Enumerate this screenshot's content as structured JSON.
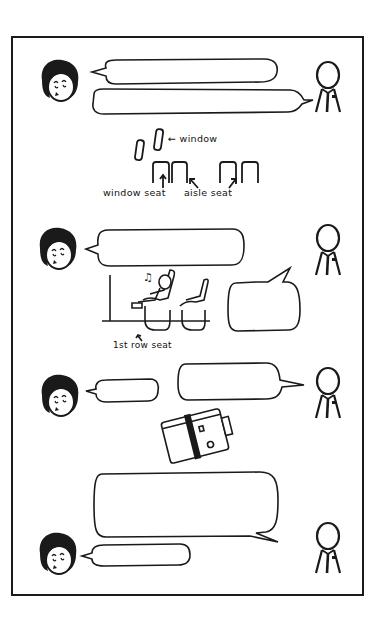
{
  "comic": {
    "panel_count": 1,
    "stroke_color": "#1a1a1a",
    "background": "#ffffff"
  },
  "characters": {
    "passenger": "woman-with-bob-haircut",
    "attendant": "stick-figure-with-tie-and-badge"
  },
  "diagram_seats": {
    "window_label": "← window",
    "window_seat_label": "window seat",
    "aisle_seat_label": "aisle seat"
  },
  "diagram_first_row": {
    "label": "1st row seat",
    "music_note": "♫"
  },
  "bubbles": [
    {
      "id": "b1",
      "speaker": "passenger",
      "text": ""
    },
    {
      "id": "b2",
      "speaker": "attendant",
      "text": ""
    },
    {
      "id": "b3",
      "speaker": "passenger",
      "text": ""
    },
    {
      "id": "b4",
      "speaker": "attendant",
      "text": ""
    },
    {
      "id": "b5",
      "speaker": "passenger",
      "text": ""
    },
    {
      "id": "b6",
      "speaker": "attendant",
      "text": ""
    },
    {
      "id": "b7",
      "speaker": "attendant",
      "text": ""
    },
    {
      "id": "b8",
      "speaker": "passenger",
      "text": ""
    }
  ]
}
